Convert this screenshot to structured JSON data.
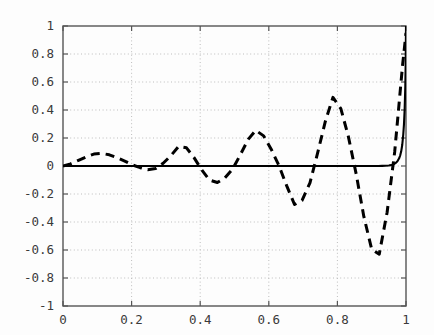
{
  "chart_data": {
    "type": "line",
    "title": "",
    "subtitle": "",
    "xlabel": "",
    "ylabel": "",
    "xlim": [
      0,
      1
    ],
    "ylim": [
      -1,
      1
    ],
    "grid": true,
    "grid_style": "dotted",
    "legend": null,
    "legend_position": "none",
    "background_color": "#fdfdfd",
    "axis_color": "#555555",
    "grid_color": "#bdbdbd",
    "xticks": [
      0,
      0.2,
      0.4,
      0.6,
      0.8,
      1
    ],
    "xtick_labels": [
      "0",
      "0.2",
      "0.4",
      "0.6",
      "0.8",
      "1"
    ],
    "yticks": [
      -1,
      -0.8,
      -0.6,
      -0.4,
      -0.2,
      0,
      0.2,
      0.4,
      0.6,
      0.8,
      1
    ],
    "ytick_labels": [
      "-1",
      "-0.8",
      "-0.6",
      "-0.4",
      "-0.2",
      "0",
      "0.2",
      "0.4",
      "0.6",
      "0.8",
      "1"
    ],
    "series": [
      {
        "name": "exact-solution",
        "style": "solid",
        "color": "#000000",
        "width": 2.1,
        "x": [
          0.0,
          0.05,
          0.1,
          0.15,
          0.2,
          0.25,
          0.3,
          0.35,
          0.4,
          0.45,
          0.5,
          0.55,
          0.6,
          0.65,
          0.7,
          0.75,
          0.8,
          0.82,
          0.84,
          0.86,
          0.88,
          0.9,
          0.91,
          0.92,
          0.93,
          0.94,
          0.95,
          0.955,
          0.96,
          0.965,
          0.97,
          0.975,
          0.98,
          0.983,
          0.986,
          0.989,
          0.992,
          0.994,
          0.996,
          0.998,
          0.999,
          1.0
        ],
        "y": [
          0.0,
          0.0,
          0.0,
          0.0,
          0.0,
          0.0,
          0.0,
          0.0,
          0.0,
          0.0,
          0.0,
          0.0,
          0.0,
          0.0,
          0.0,
          0.0,
          0.0,
          0.0,
          0.0,
          0.0,
          0.0,
          0.0,
          0.0,
          0.0,
          0.001,
          0.002,
          0.004,
          0.006,
          0.009,
          0.014,
          0.022,
          0.034,
          0.055,
          0.075,
          0.105,
          0.15,
          0.225,
          0.295,
          0.4,
          0.57,
          0.72,
          1.0
        ]
      },
      {
        "name": "numerical-solution",
        "style": "dashed",
        "color": "#000000",
        "width": 3.0,
        "dash_pattern": "9,6",
        "x": [
          0.0,
          0.022,
          0.045,
          0.068,
          0.09,
          0.112,
          0.135,
          0.157,
          0.18,
          0.202,
          0.225,
          0.247,
          0.27,
          0.292,
          0.315,
          0.337,
          0.36,
          0.382,
          0.405,
          0.427,
          0.45,
          0.472,
          0.495,
          0.517,
          0.54,
          0.562,
          0.585,
          0.607,
          0.63,
          0.652,
          0.675,
          0.697,
          0.72,
          0.742,
          0.765,
          0.787,
          0.81,
          0.832,
          0.855,
          0.877,
          0.9,
          0.922,
          0.945,
          0.967,
          0.99,
          1.0
        ],
        "y": [
          0.0,
          0.015,
          0.04,
          0.065,
          0.085,
          0.09,
          0.08,
          0.06,
          0.035,
          0.008,
          -0.012,
          -0.026,
          -0.018,
          0.02,
          0.075,
          0.14,
          0.13,
          0.06,
          -0.03,
          -0.1,
          -0.118,
          -0.085,
          -0.02,
          0.08,
          0.19,
          0.255,
          0.215,
          0.12,
          0.0,
          -0.14,
          -0.275,
          -0.245,
          -0.12,
          0.09,
          0.32,
          0.49,
          0.41,
          0.21,
          -0.06,
          -0.36,
          -0.595,
          -0.63,
          -0.33,
          0.1,
          0.72,
          0.95
        ]
      }
    ]
  },
  "axes": {
    "plot_left_px": 63,
    "plot_right_px": 406,
    "plot_top_px": 26,
    "plot_bottom_px": 306
  }
}
